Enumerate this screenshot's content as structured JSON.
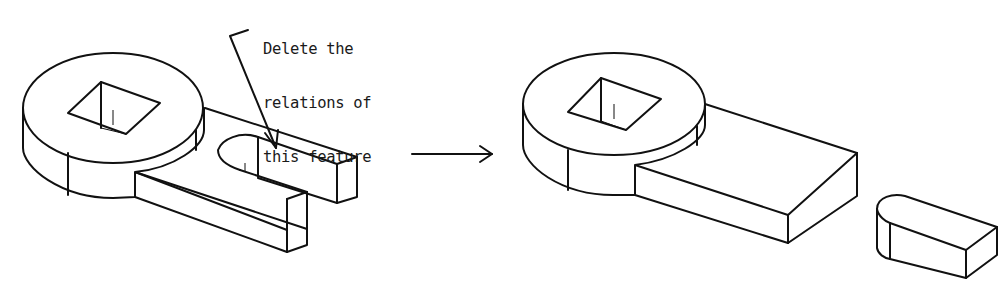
{
  "figure": {
    "annotation": {
      "lines": [
        "Delete the",
        "relations of",
        "this feature"
      ]
    },
    "panels": [
      {
        "id": "before",
        "description": "Wrench-like part: cylindrical hub with square hole and a slotted arm (U-slot feature)"
      },
      {
        "id": "after",
        "description": "Same part with solid rectangular arm; the slot feature becomes a separate detached key-shaped body"
      }
    ],
    "transition_arrow": "right-arrow",
    "colors": {
      "stroke": "#111111",
      "background": "#ffffff"
    }
  }
}
